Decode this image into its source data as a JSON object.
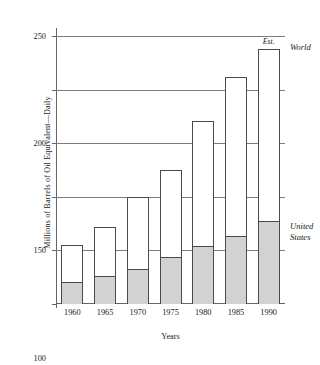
{
  "chart_data": {
    "type": "bar",
    "title": "",
    "subtitle": "",
    "xlabel": "Years",
    "ylabel": "Millions of Barrels of Oil Equivalent—Daily",
    "categories": [
      "1960",
      "1965",
      "1970",
      "1975",
      "1980",
      "1985",
      "1990"
    ],
    "series": [
      {
        "name": "World",
        "values": [
          55,
          72,
          100,
          125,
          171,
          212,
          238
        ]
      },
      {
        "name": "United States",
        "values": [
          21,
          26,
          33,
          44,
          54,
          63,
          77
        ]
      }
    ],
    "ylim": [
      0,
      250
    ],
    "yticks": [
      0,
      50,
      100,
      150,
      200,
      250
    ],
    "ytick_labels": [
      "0",
      "50",
      "100",
      "150",
      "200",
      "250"
    ],
    "grid": true,
    "legend_position": "right-inline",
    "annotations": [
      {
        "text": "Est.",
        "target": "1990",
        "placement": "above-bar",
        "style": "italic"
      }
    ],
    "series_labels": {
      "world": "World",
      "united_states_line1": "United",
      "united_states_line2": "States"
    },
    "colors": {
      "world_fill": "#ffffff",
      "united_states_fill": "#d2d2d2",
      "bar_border": "#4a4a4a",
      "gridline": "#7d7d7d",
      "axis": "#666666",
      "text": "#1a1a1a",
      "background": "#ffffff"
    }
  }
}
